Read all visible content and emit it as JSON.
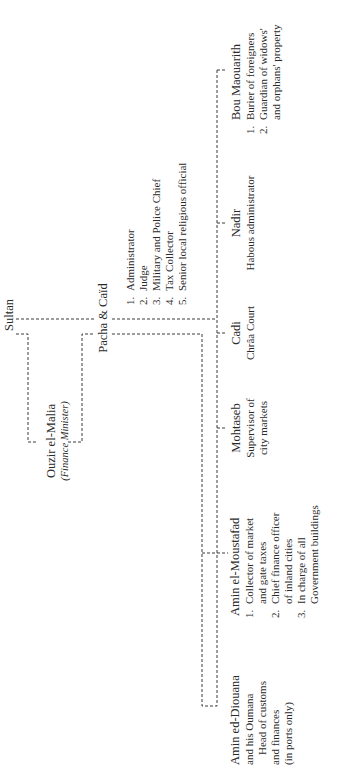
{
  "diagram": {
    "type": "org-chart",
    "orientation": "rotated-90-ccw",
    "root": {
      "label": "Sultan"
    },
    "advisor": {
      "label": "Ouzir el-Malia",
      "note": "(Finance Minister)"
    },
    "governor": {
      "label": "Pacha & Caïd",
      "duties": [
        {
          "num": "1.",
          "text": "Administrator"
        },
        {
          "num": "2.",
          "text": "Judge"
        },
        {
          "num": "3.",
          "text": "Military and Police Chief"
        },
        {
          "num": "4.",
          "text": "Tax Collector"
        },
        {
          "num": "5.",
          "text": "Senior local religious official"
        }
      ]
    },
    "officials": [
      {
        "label": "Amin ed-Diouana",
        "lines": [
          "and his Oumana",
          "Head of customs",
          "and finances",
          "(in ports only)"
        ]
      },
      {
        "label": "Amin el-Moustafad",
        "duties": [
          {
            "num": "1.",
            "lines": [
              "Collector of market",
              "and gate taxes"
            ]
          },
          {
            "num": "2.",
            "lines": [
              "Chief finance officer",
              "of inland cities"
            ]
          },
          {
            "num": "3.",
            "lines": [
              "In charge of all",
              "Government buildings"
            ]
          }
        ]
      },
      {
        "label": "Mohtaseb",
        "lines": [
          "Supervisor of",
          "city markets"
        ]
      },
      {
        "label": "Cadi",
        "lines": [
          "Chrâa Court"
        ]
      },
      {
        "label": "Nadir",
        "lines": [
          "Habous administrator"
        ]
      },
      {
        "label": "Bou Maouarith",
        "duties": [
          {
            "num": "1.",
            "lines": [
              "Burier of foreigners"
            ]
          },
          {
            "num": "2.",
            "lines": [
              "Guardian of widows'",
              "and orphans' property"
            ]
          }
        ]
      }
    ],
    "colors": {
      "background": "#ffffff",
      "ink": "#2a2a2a",
      "line": "#3a3a3a"
    }
  }
}
